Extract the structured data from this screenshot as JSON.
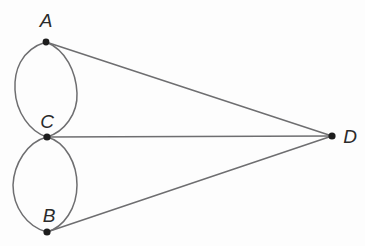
{
  "figure": {
    "background_color": "#fdfdfd",
    "stroke_color": "#6e6e70",
    "vertex_color": "#1d1d1d",
    "label_color": "#2b2b2b",
    "width": 365,
    "height": 246,
    "vertices": [
      {
        "id": "A",
        "label": "A",
        "x": 46,
        "y": 42,
        "label_x": 46,
        "label_y": 27,
        "radius": 3.4
      },
      {
        "id": "C",
        "label": "C",
        "x": 47,
        "y": 137,
        "label_x": 47,
        "label_y": 128,
        "radius": 3.6
      },
      {
        "id": "B",
        "label": "B",
        "x": 47,
        "y": 232,
        "label_x": 49,
        "label_y": 222,
        "radius": 3.6
      },
      {
        "id": "D",
        "label": "D",
        "x": 332,
        "y": 136,
        "label_x": 350,
        "label_y": 143,
        "radius": 3.6
      }
    ],
    "edges": [
      {
        "id": "A-D",
        "from": "A",
        "to": "D",
        "kind": "straight"
      },
      {
        "id": "C-D",
        "from": "C",
        "to": "D",
        "kind": "straight"
      },
      {
        "id": "B-D",
        "from": "B",
        "to": "D",
        "kind": "straight"
      },
      {
        "id": "A-C-left",
        "from": "A",
        "to": "C",
        "kind": "curve",
        "bulge": "left"
      },
      {
        "id": "A-C-right",
        "from": "A",
        "to": "C",
        "kind": "curve",
        "bulge": "right"
      },
      {
        "id": "C-B-left",
        "from": "C",
        "to": "B",
        "kind": "curve",
        "bulge": "left"
      },
      {
        "id": "C-B-right",
        "from": "C",
        "to": "B",
        "kind": "curve",
        "bulge": "right"
      }
    ],
    "paths": {
      "upper_loop_left": "M 46 42 C 20 50 14 72 15 90 C 16 112 30 132 47 137",
      "upper_loop_right": "M 46 42 C 66 50 76 72 77 93 C 78 114 64 132 47 137",
      "lower_loop_left": "M 47 137 C 27 142 14 164 13 185 C 13 207 27 227 47 232",
      "lower_loop_right": "M 47 137 C 66 142 77 164 77 185 C 77 208 64 227 47 232",
      "edge_a_d": "M 46 42 L 332 136",
      "edge_c_d": "M 47 137 L 332 136",
      "edge_b_d": "M 47 232 L 332 136"
    }
  }
}
